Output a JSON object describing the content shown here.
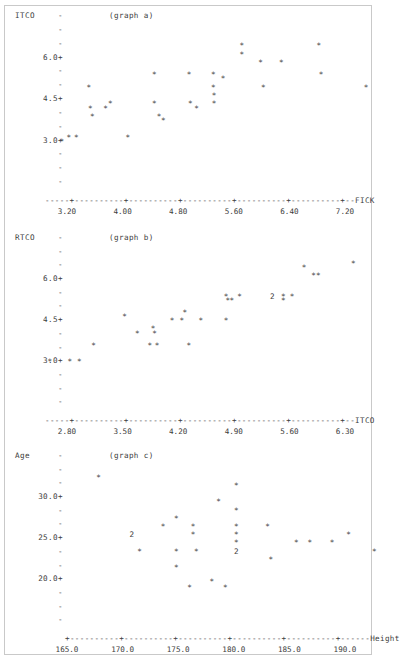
{
  "document": {
    "kind": "character-plot-output",
    "border_color": "#c9c9c9",
    "text_color": "#3c3c3c",
    "point_glyph": "*",
    "pair_glyph": "2",
    "tick_glyph": "-",
    "labeled_tick_glyph": "+"
  },
  "chart_data": [
    {
      "type": "scatter",
      "title": "(graph a)",
      "ylabel": "ITCO",
      "xlabel": "FICK",
      "yticks": [
        "6.0+",
        "4.5+",
        "3.0+"
      ],
      "ytick_values": [
        6.0,
        4.5,
        3.0
      ],
      "xticks": [
        "3.20",
        "4.00",
        "4.80",
        "5.60",
        "6.40",
        "7.20"
      ],
      "xtick_values": [
        3.2,
        4.0,
        4.8,
        5.6,
        6.4,
        7.2
      ],
      "xlim": [
        2.85,
        7.65
      ],
      "ylim": [
        2.4,
        6.75
      ],
      "grid": false,
      "legend": "none",
      "axis_line": "-----+----------+----------+----------+----------+----------+--FICK",
      "points": [
        {
          "x": 3.12,
          "y": 2.85,
          "n": 1
        },
        {
          "x": 3.22,
          "y": 3.0,
          "n": 1
        },
        {
          "x": 3.33,
          "y": 3.0,
          "n": 1
        },
        {
          "x": 3.51,
          "y": 4.8,
          "n": 1
        },
        {
          "x": 3.53,
          "y": 4.05,
          "n": 1
        },
        {
          "x": 3.56,
          "y": 3.75,
          "n": 1
        },
        {
          "x": 3.75,
          "y": 4.05,
          "n": 1
        },
        {
          "x": 3.82,
          "y": 4.2,
          "n": 1
        },
        {
          "x": 4.07,
          "y": 3.0,
          "n": 1
        },
        {
          "x": 4.45,
          "y": 5.25,
          "n": 1
        },
        {
          "x": 4.45,
          "y": 4.2,
          "n": 1
        },
        {
          "x": 4.52,
          "y": 3.75,
          "n": 1
        },
        {
          "x": 4.58,
          "y": 3.6,
          "n": 1
        },
        {
          "x": 4.95,
          "y": 5.25,
          "n": 1
        },
        {
          "x": 4.97,
          "y": 4.2,
          "n": 1
        },
        {
          "x": 5.06,
          "y": 4.05,
          "n": 1
        },
        {
          "x": 5.3,
          "y": 5.25,
          "n": 1
        },
        {
          "x": 5.3,
          "y": 4.8,
          "n": 1
        },
        {
          "x": 5.31,
          "y": 4.5,
          "n": 1
        },
        {
          "x": 5.31,
          "y": 4.2,
          "n": 1
        },
        {
          "x": 5.44,
          "y": 5.1,
          "n": 1
        },
        {
          "x": 5.71,
          "y": 6.3,
          "n": 1
        },
        {
          "x": 5.71,
          "y": 6.0,
          "n": 1
        },
        {
          "x": 5.98,
          "y": 5.7,
          "n": 1
        },
        {
          "x": 6.02,
          "y": 4.8,
          "n": 1
        },
        {
          "x": 6.28,
          "y": 5.7,
          "n": 1
        },
        {
          "x": 6.82,
          "y": 6.3,
          "n": 1
        },
        {
          "x": 6.85,
          "y": 5.25,
          "n": 1
        },
        {
          "x": 7.5,
          "y": 4.8,
          "n": 1
        }
      ]
    },
    {
      "type": "scatter",
      "title": "(graph b)",
      "ylabel": "RTCO",
      "xlabel": "ITCO",
      "yticks": [
        "6.0+",
        "4.5+",
        "3.0+"
      ],
      "ytick_values": [
        6.0,
        4.5,
        3.0
      ],
      "xticks": [
        "2.80",
        "3.50",
        "4.20",
        "4.90",
        "5.60",
        "6.30"
      ],
      "xtick_values": [
        2.8,
        3.5,
        4.2,
        4.9,
        5.6,
        6.3
      ],
      "xlim": [
        2.5,
        6.75
      ],
      "ylim": [
        2.4,
        6.75
      ],
      "grid": false,
      "legend": "none",
      "axis_line": "-----+----------+----------+----------+----------+----------+--ITCO",
      "points": [
        {
          "x": 2.58,
          "y": 2.85,
          "n": 1
        },
        {
          "x": 2.83,
          "y": 2.85,
          "n": 1
        },
        {
          "x": 2.95,
          "y": 2.85,
          "n": 1
        },
        {
          "x": 3.13,
          "y": 3.45,
          "n": 1
        },
        {
          "x": 3.52,
          "y": 4.5,
          "n": 1
        },
        {
          "x": 3.68,
          "y": 3.9,
          "n": 1
        },
        {
          "x": 3.88,
          "y": 4.05,
          "n": 1
        },
        {
          "x": 3.9,
          "y": 3.9,
          "n": 1
        },
        {
          "x": 3.84,
          "y": 3.45,
          "n": 1
        },
        {
          "x": 3.93,
          "y": 3.45,
          "n": 1
        },
        {
          "x": 4.12,
          "y": 4.35,
          "n": 1
        },
        {
          "x": 4.24,
          "y": 4.35,
          "n": 1
        },
        {
          "x": 4.28,
          "y": 4.65,
          "n": 1
        },
        {
          "x": 4.33,
          "y": 3.45,
          "n": 1
        },
        {
          "x": 4.48,
          "y": 4.35,
          "n": 1
        },
        {
          "x": 4.8,
          "y": 5.25,
          "n": 1
        },
        {
          "x": 4.82,
          "y": 5.1,
          "n": 1
        },
        {
          "x": 4.87,
          "y": 5.1,
          "n": 1
        },
        {
          "x": 4.8,
          "y": 4.35,
          "n": 1
        },
        {
          "x": 4.97,
          "y": 5.25,
          "n": 1
        },
        {
          "x": 5.38,
          "y": 5.25,
          "n": 2
        },
        {
          "x": 5.52,
          "y": 5.25,
          "n": 1
        },
        {
          "x": 5.63,
          "y": 5.25,
          "n": 1
        },
        {
          "x": 5.52,
          "y": 5.1,
          "n": 1
        },
        {
          "x": 5.9,
          "y": 6.0,
          "n": 1
        },
        {
          "x": 5.96,
          "y": 6.0,
          "n": 1
        },
        {
          "x": 5.78,
          "y": 6.3,
          "n": 1
        },
        {
          "x": 6.4,
          "y": 6.45,
          "n": 1
        }
      ]
    },
    {
      "type": "scatter",
      "title": "(graph c)",
      "ylabel": "Age",
      "xlabel": "Height",
      "yticks": [
        "30.0+",
        "25.0+",
        "20.0+"
      ],
      "ytick_values": [
        30.0,
        25.0,
        20.0
      ],
      "xticks": [
        "165.0",
        "170.0",
        "175.0",
        "180.0",
        "185.0",
        "190.0"
      ],
      "xtick_values": [
        165.0,
        170.0,
        175.0,
        180.0,
        185.0,
        190.0
      ],
      "xlim": [
        163.5,
        194.5
      ],
      "ylim": [
        17.5,
        32.5
      ],
      "grid": false,
      "legend": "none",
      "axis_line": "+----------+----------+----------+----------+----------+------Height",
      "points": [
        {
          "x": 167.8,
          "y": 32.0,
          "n": 1
        },
        {
          "x": 180.2,
          "y": 31.0,
          "n": 1
        },
        {
          "x": 178.6,
          "y": 29.0,
          "n": 1
        },
        {
          "x": 180.2,
          "y": 28.0,
          "n": 1
        },
        {
          "x": 174.8,
          "y": 27.0,
          "n": 1
        },
        {
          "x": 173.6,
          "y": 26.0,
          "n": 1
        },
        {
          "x": 176.3,
          "y": 26.0,
          "n": 1
        },
        {
          "x": 180.2,
          "y": 26.0,
          "n": 1
        },
        {
          "x": 183.0,
          "y": 26.0,
          "n": 1
        },
        {
          "x": 170.8,
          "y": 25.0,
          "n": 2
        },
        {
          "x": 176.3,
          "y": 25.0,
          "n": 1
        },
        {
          "x": 180.2,
          "y": 25.0,
          "n": 1
        },
        {
          "x": 190.3,
          "y": 25.0,
          "n": 1
        },
        {
          "x": 180.2,
          "y": 24.0,
          "n": 1
        },
        {
          "x": 185.6,
          "y": 24.0,
          "n": 1
        },
        {
          "x": 186.8,
          "y": 24.0,
          "n": 1
        },
        {
          "x": 188.8,
          "y": 24.0,
          "n": 1
        },
        {
          "x": 171.5,
          "y": 23.0,
          "n": 1
        },
        {
          "x": 174.8,
          "y": 23.0,
          "n": 1
        },
        {
          "x": 176.6,
          "y": 23.0,
          "n": 1
        },
        {
          "x": 180.2,
          "y": 23.0,
          "n": 2
        },
        {
          "x": 192.6,
          "y": 23.0,
          "n": 1
        },
        {
          "x": 183.3,
          "y": 22.0,
          "n": 1
        },
        {
          "x": 174.8,
          "y": 21.0,
          "n": 1
        },
        {
          "x": 178.0,
          "y": 19.3,
          "n": 1
        },
        {
          "x": 176.0,
          "y": 18.6,
          "n": 1
        },
        {
          "x": 179.2,
          "y": 18.6,
          "n": 1
        }
      ]
    }
  ]
}
